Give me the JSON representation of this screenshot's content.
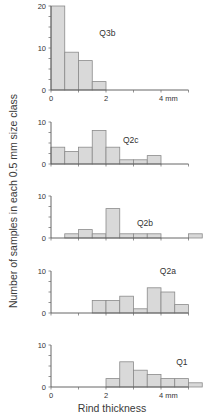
{
  "figure": {
    "ylabel": "Number of samples in each 0.5 mm size class",
    "xlabel": "Rind thickness"
  },
  "colors": {
    "bar_fill": "#d9d9d9",
    "bar_stroke": "#8a8a8a",
    "axis": "#555555",
    "text": "#333333"
  },
  "chart_data": {
    "type": "bar",
    "subtype": "stacked-panel histograms",
    "title": "",
    "xlabel": "Rind thickness",
    "ylabel": "Number of samples in each 0.5 mm size class",
    "bin_width_mm": 0.5,
    "categories": [
      "0-0.5",
      "0.5-1",
      "1-1.5",
      "1.5-2",
      "2-2.5",
      "2.5-3",
      "3-3.5",
      "3.5-4",
      "4-4.5",
      "4.5-5",
      "5-5.5"
    ],
    "xlim": [
      0,
      5
    ],
    "x_ticks": [
      0,
      1,
      2,
      3,
      4,
      5
    ],
    "x_tick_labels": [
      "0",
      "2",
      "4 mm"
    ],
    "x_tick_label_positions": [
      0,
      2,
      4
    ],
    "grid": false,
    "legend": null,
    "series": [
      {
        "name": "Q3b",
        "ylim": [
          0,
          20
        ],
        "y_tick_labels": [
          "0",
          "10",
          "20"
        ],
        "y_tick_label_values": [
          0,
          10,
          20
        ],
        "show_x_tick_labels": true,
        "label_pos": {
          "x_mm": 2.05,
          "y": 13.5
        },
        "values": [
          20,
          9,
          7,
          2,
          0,
          0,
          0,
          0,
          0,
          0,
          0
        ]
      },
      {
        "name": "Q2c",
        "ylim": [
          0,
          10
        ],
        "y_tick_labels": [
          "0",
          "10"
        ],
        "y_tick_label_values": [
          0,
          10
        ],
        "show_x_tick_labels": false,
        "label_pos": {
          "x_mm": 2.9,
          "y": 5.8
        },
        "values": [
          4,
          3,
          4,
          8,
          4,
          1,
          1,
          2,
          0,
          0,
          0
        ]
      },
      {
        "name": "Q2b",
        "ylim": [
          0,
          10
        ],
        "y_tick_labels": [
          "0",
          "10"
        ],
        "y_tick_label_values": [
          0,
          10
        ],
        "show_x_tick_labels": false,
        "label_pos": {
          "x_mm": 3.42,
          "y": 3.6
        },
        "values": [
          0,
          1,
          2,
          1,
          7,
          1,
          1,
          1,
          0,
          0,
          1
        ]
      },
      {
        "name": "Q2a",
        "ylim": [
          0,
          10
        ],
        "y_tick_labels": [
          "0",
          "10"
        ],
        "y_tick_label_values": [
          0,
          10
        ],
        "show_x_tick_labels": false,
        "label_pos": {
          "x_mm": 4.25,
          "y": 10.0
        },
        "values": [
          0,
          0,
          0,
          3,
          3,
          4,
          1,
          6,
          5,
          2,
          0
        ]
      },
      {
        "name": "Q1",
        "ylim": [
          0,
          10
        ],
        "y_tick_labels": [
          "0",
          "10"
        ],
        "y_tick_label_values": [
          0,
          10
        ],
        "show_x_tick_labels": true,
        "label_pos": {
          "x_mm": 4.76,
          "y": 6.0
        },
        "values": [
          0,
          0,
          0,
          0,
          2,
          6,
          4,
          3,
          2,
          2,
          1
        ]
      }
    ]
  }
}
